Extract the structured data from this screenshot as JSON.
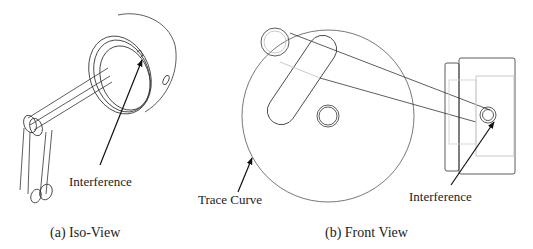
{
  "panels": [
    {
      "id": "a",
      "caption": "(a) Iso-View",
      "annotations": [
        {
          "text": "Interference"
        }
      ]
    },
    {
      "id": "b",
      "caption": "(b) Front View",
      "annotations": [
        {
          "text": "Trace Curve"
        },
        {
          "text": "Interference"
        }
      ]
    }
  ],
  "colors": {
    "line": "#333333",
    "faint": "#bbbbbb",
    "background": "#ffffff"
  }
}
